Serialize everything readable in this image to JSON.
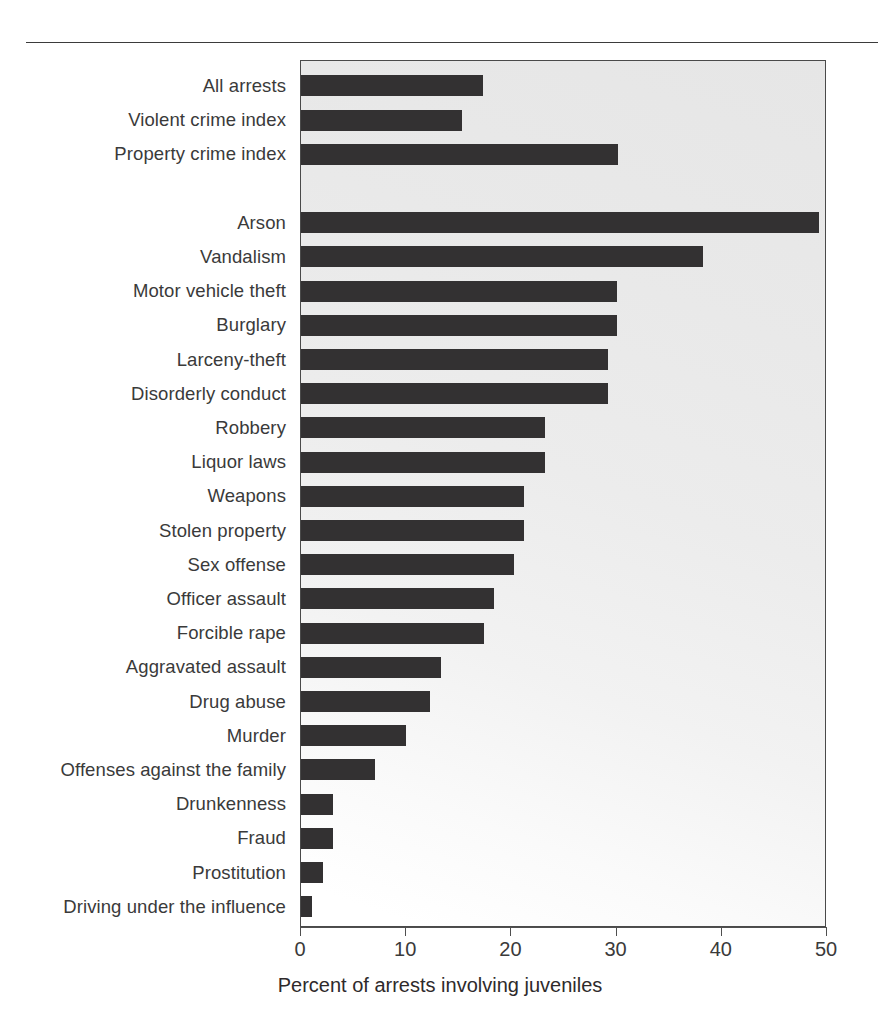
{
  "figure": {
    "divider": "top-rule",
    "bar_color": "#333132",
    "plot_background": "#ebebeb",
    "frame_color": "#4a4a4a"
  },
  "chart_data": {
    "type": "bar",
    "orientation": "horizontal",
    "title": "",
    "xlabel": "Percent of arrests involving juveniles",
    "ylabel": "",
    "xlim": [
      0,
      50
    ],
    "xticks": [
      0,
      10,
      20,
      30,
      40,
      50
    ],
    "xtick_labels": [
      "0",
      "10",
      "20",
      "30",
      "40",
      "50"
    ],
    "grid": false,
    "legend": null,
    "categories": [
      "All arrests",
      "Violent crime index",
      "Property crime index",
      "",
      "Arson",
      "Vandalism",
      "Motor vehicle theft",
      "Burglary",
      "Larceny-theft",
      "Disorderly conduct",
      "Robbery",
      "Liquor laws",
      "Weapons",
      "Stolen property",
      "Sex offense",
      "Officer assault",
      "Forcible rape",
      "Aggravated assault",
      "Drug abuse",
      "Murder",
      "Offenses against the family",
      "Drunkenness",
      "Fraud",
      "Prostitution",
      "Driving under the influence"
    ],
    "values": [
      17.3,
      15.3,
      30.1,
      null,
      49.2,
      38.2,
      30.0,
      30.0,
      29.2,
      29.2,
      23.2,
      23.2,
      21.2,
      21.2,
      20.2,
      18.3,
      17.4,
      13.3,
      12.3,
      10.0,
      7.0,
      3.0,
      3.0,
      2.1,
      1.0
    ]
  }
}
